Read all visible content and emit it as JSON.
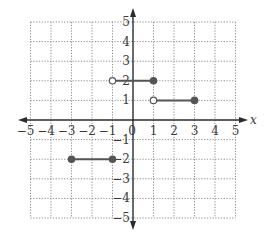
{
  "chart_data": {
    "type": "line",
    "title": "",
    "xlabel": "x",
    "ylabel": "",
    "xlim": [
      -5,
      5
    ],
    "ylim": [
      -5,
      5
    ],
    "grid": true,
    "grid_style": "dotted",
    "x_ticks": [
      -5,
      -4,
      -3,
      -2,
      -1,
      0,
      1,
      2,
      3,
      4,
      5
    ],
    "x_tick_labels": [
      "−5",
      "−4",
      "−3",
      "−2",
      "−1",
      "0",
      "1",
      "2",
      "3",
      "4",
      "5"
    ],
    "y_ticks": [
      5,
      4,
      3,
      2,
      1,
      -1,
      -2,
      -3,
      -4,
      -5
    ],
    "y_tick_labels": [
      "5",
      "4",
      "3",
      "2",
      "1",
      "−1",
      "−2",
      "−3",
      "−4",
      "−5"
    ],
    "series": [
      {
        "name": "segment-1",
        "points": [
          [
            -3,
            -2
          ],
          [
            -1,
            -2
          ]
        ],
        "endpoints": [
          "closed",
          "closed"
        ]
      },
      {
        "name": "segment-2",
        "points": [
          [
            -1,
            2
          ],
          [
            1,
            2
          ]
        ],
        "endpoints": [
          "open",
          "closed"
        ]
      },
      {
        "name": "segment-3",
        "points": [
          [
            1,
            1
          ],
          [
            3,
            1
          ]
        ],
        "endpoints": [
          "open",
          "closed"
        ]
      }
    ],
    "colors": {
      "axis": "#2b2b2b",
      "grid": "#8a8a8a",
      "segment": "#555555",
      "open_fill": "#ffffff"
    }
  }
}
